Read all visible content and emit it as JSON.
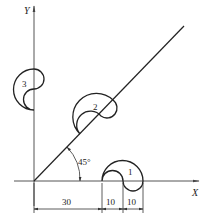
{
  "diagram": {
    "axes": {
      "x_label": "X",
      "y_label": "Y"
    },
    "angle_label": "45°",
    "shapes": [
      {
        "id": "1",
        "label": "1"
      },
      {
        "id": "2",
        "label": "2"
      },
      {
        "id": "3",
        "label": "3"
      }
    ],
    "dimensions": [
      {
        "label": "30"
      },
      {
        "label": "10"
      },
      {
        "label": "10"
      }
    ],
    "colors": {
      "stroke": "#222222",
      "axis": "#555555",
      "background": "#ffffff"
    }
  }
}
